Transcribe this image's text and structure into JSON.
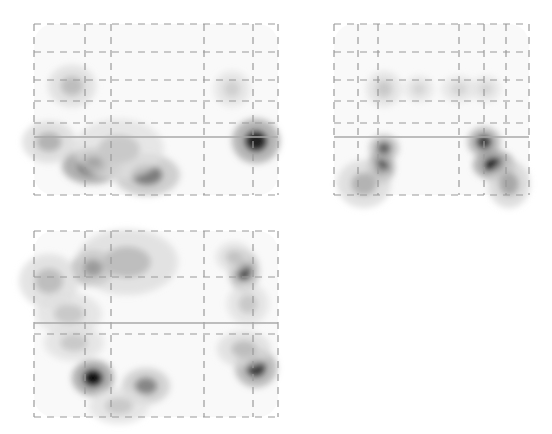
{
  "figure": {
    "type": "glass-brain-maximum-intensity-projection",
    "background": "#ffffff",
    "colors": {
      "grid_line": "#9a9a9a",
      "crosshair": "#a8a8a8",
      "outline_haze": "#efefef",
      "blob_darkest": "#0a0a0a"
    },
    "panels": [
      {
        "id": "sagittal",
        "x": 33,
        "y": 23,
        "w": 244,
        "h": 171,
        "v_lines": [
          0,
          51,
          77,
          170,
          219,
          244
        ],
        "h_lines": [
          0,
          28,
          56,
          77,
          99,
          171
        ],
        "crosshair_y": 113,
        "brackets": [
          [
            51,
            77,
            0,
            77
          ],
          [
            51,
            77,
            145,
            171
          ],
          [
            219,
            244,
            0,
            77
          ],
          [
            219,
            244,
            145,
            171
          ]
        ],
        "blobs": [
          {
            "cx": 58,
            "cy": 142,
            "rx": 20,
            "ry": 12,
            "v": 1.0
          },
          {
            "cx": 60,
            "cy": 138,
            "rx": 12,
            "ry": 8,
            "v": 0.9
          },
          {
            "cx": 113,
            "cy": 151,
            "rx": 22,
            "ry": 14,
            "v": 0.5
          },
          {
            "cx": 38,
            "cy": 62,
            "rx": 16,
            "ry": 14,
            "v": 0.2
          },
          {
            "cx": 222,
            "cy": 117,
            "rx": 16,
            "ry": 15,
            "v": 0.9
          },
          {
            "cx": 198,
            "cy": 65,
            "rx": 12,
            "ry": 12,
            "v": 0.12
          },
          {
            "cx": 15,
            "cy": 118,
            "rx": 18,
            "ry": 14,
            "v": 0.25
          },
          {
            "cx": 85,
            "cy": 125,
            "rx": 30,
            "ry": 20,
            "v": 0.15
          }
        ]
      },
      {
        "id": "coronal",
        "x": 333,
        "y": 23,
        "w": 195,
        "h": 171,
        "v_lines": [
          0,
          24,
          44,
          125,
          150,
          172,
          195
        ],
        "h_lines": [
          0,
          28,
          56,
          77,
          99,
          171
        ],
        "crosshair_y": 113,
        "brackets": [
          [
            24,
            44,
            0,
            77
          ],
          [
            24,
            44,
            145,
            171
          ],
          [
            150,
            172,
            0,
            77
          ],
          [
            150,
            172,
            145,
            171
          ]
        ],
        "blobs": [
          {
            "cx": 47,
            "cy": 143,
            "rx": 9,
            "ry": 11,
            "v": 1.0
          },
          {
            "cx": 50,
            "cy": 124,
            "rx": 10,
            "ry": 9,
            "v": 0.6
          },
          {
            "cx": 30,
            "cy": 160,
            "rx": 18,
            "ry": 16,
            "v": 0.25
          },
          {
            "cx": 150,
            "cy": 118,
            "rx": 11,
            "ry": 10,
            "v": 0.8
          },
          {
            "cx": 160,
            "cy": 141,
            "rx": 14,
            "ry": 10,
            "v": 1.0
          },
          {
            "cx": 175,
            "cy": 160,
            "rx": 14,
            "ry": 16,
            "v": 0.3
          },
          {
            "cx": 50,
            "cy": 65,
            "rx": 12,
            "ry": 12,
            "v": 0.15
          },
          {
            "cx": 85,
            "cy": 65,
            "rx": 10,
            "ry": 9,
            "v": 0.1
          },
          {
            "cx": 125,
            "cy": 65,
            "rx": 12,
            "ry": 9,
            "v": 0.1
          },
          {
            "cx": 152,
            "cy": 65,
            "rx": 10,
            "ry": 9,
            "v": 0.1
          }
        ]
      },
      {
        "id": "axial",
        "x": 33,
        "y": 230,
        "w": 244,
        "h": 186,
        "v_lines": [
          0,
          51,
          77,
          170,
          219,
          244
        ],
        "h_lines": [
          0,
          46,
          103,
          186
        ],
        "crosshair_y": 92,
        "brackets": [
          [
            51,
            77,
            0,
            186
          ],
          [
            219,
            244,
            0,
            186
          ]
        ],
        "blobs": [
          {
            "cx": 59,
            "cy": 37,
            "rx": 14,
            "ry": 12,
            "v": 1.0
          },
          {
            "cx": 59,
            "cy": 147,
            "rx": 14,
            "ry": 12,
            "v": 1.0
          },
          {
            "cx": 112,
            "cy": 155,
            "rx": 16,
            "ry": 12,
            "v": 0.45
          },
          {
            "cx": 93,
            "cy": 31,
            "rx": 34,
            "ry": 22,
            "v": 0.2
          },
          {
            "cx": 15,
            "cy": 50,
            "rx": 20,
            "ry": 18,
            "v": 0.2
          },
          {
            "cx": 35,
            "cy": 83,
            "rx": 22,
            "ry": 14,
            "v": 0.15
          },
          {
            "cx": 40,
            "cy": 112,
            "rx": 20,
            "ry": 12,
            "v": 0.15
          },
          {
            "cx": 210,
            "cy": 40,
            "rx": 10,
            "ry": 14,
            "v": 0.7
          },
          {
            "cx": 200,
            "cy": 26,
            "rx": 12,
            "ry": 10,
            "v": 0.18
          },
          {
            "cx": 214,
            "cy": 73,
            "rx": 14,
            "ry": 14,
            "v": 0.15
          },
          {
            "cx": 222,
            "cy": 137,
            "rx": 14,
            "ry": 13,
            "v": 0.8
          },
          {
            "cx": 210,
            "cy": 118,
            "rx": 18,
            "ry": 12,
            "v": 0.2
          },
          {
            "cx": 85,
            "cy": 175,
            "rx": 20,
            "ry": 12,
            "v": 0.15
          }
        ]
      }
    ]
  }
}
